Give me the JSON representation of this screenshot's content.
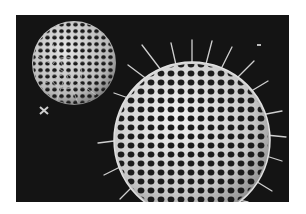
{
  "image": {
    "description": "Scanning electron micrograph of two radiolarian skeletons: a smaller lattice sphere (partially open) at upper left and a larger spiny lattice sphere at right, on a black background",
    "background_color": "#141414",
    "frame_color": "#ffffff",
    "shell_color": "#d8d8d8",
    "pore_color": "#1a1a1a",
    "subjects": [
      {
        "name": "small-radiolarian",
        "cx": 58,
        "cy": 48,
        "r": 42
      },
      {
        "name": "large-radiolarian",
        "cx": 176,
        "cy": 125,
        "r": 78
      }
    ]
  }
}
